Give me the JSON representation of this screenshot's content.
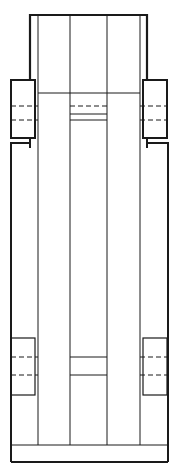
{
  "drawing": {
    "title": "",
    "width": 182,
    "height": 466,
    "stroke_color": "#1a1a1a",
    "background": "#ffffff",
    "description": "Technical line drawing, elevation view of a tall rectangular assembly with vertical members and side clamp blocks"
  }
}
